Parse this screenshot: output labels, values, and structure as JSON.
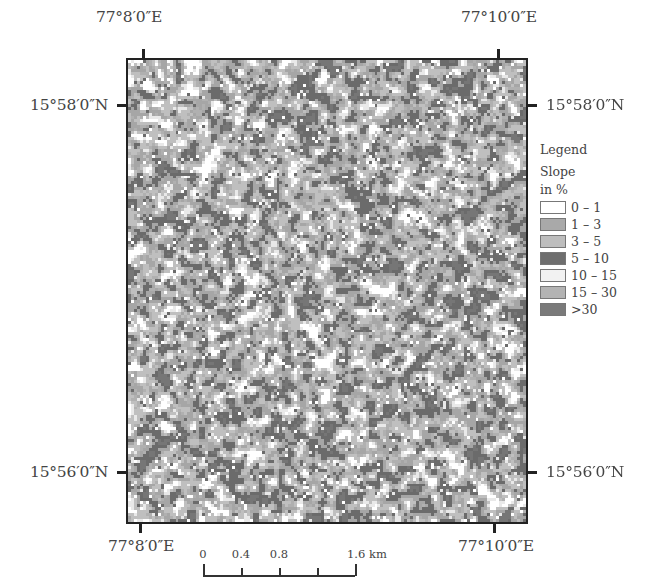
{
  "map": {
    "frame": {
      "left": 126,
      "top": 58,
      "width": 402,
      "height": 466
    },
    "raster": {
      "cols": 134,
      "rows": 156,
      "seed": 1598,
      "class_weights": [
        0.07,
        0.27,
        0.26,
        0.2,
        0.06,
        0.1,
        0.04
      ]
    }
  },
  "coordinates": {
    "top_left_lon": "77°8′0″E",
    "top_right_lon": "77°10′0″E",
    "bottom_left_lon": "77°8′0″E",
    "bottom_right_lon": "77°10′0″E",
    "left_top_lat": "15°58′0″N",
    "right_top_lat": "15°58′0″N",
    "left_bottom_lat": "15°56′0″N",
    "right_bottom_lat": "15°56′0″N"
  },
  "legend": {
    "title": "Legend",
    "subtitle_line1": "Slope",
    "subtitle_line2": "in %",
    "items": [
      {
        "label": "0 – 1",
        "color": "#ffffff"
      },
      {
        "label": "1 – 3",
        "color": "#a9a9a9"
      },
      {
        "label": "3 – 5",
        "color": "#bdbdbd"
      },
      {
        "label": "5 – 10",
        "color": "#6e6e6e"
      },
      {
        "label": "10 – 15",
        "color": "#f2f2f2"
      },
      {
        "label": "15 – 30",
        "color": "#b3b3b3"
      },
      {
        "label": ">30",
        "color": "#7a7a7a"
      }
    ]
  },
  "scalebar": {
    "labels": [
      {
        "text": "0",
        "pos": 5
      },
      {
        "text": "0.4",
        "pos": 43
      },
      {
        "text": "0.8",
        "pos": 81
      },
      {
        "text": "1.6 km",
        "pos": 157
      }
    ],
    "ticks": [
      5,
      43,
      81,
      119,
      157
    ],
    "unit": "km"
  }
}
